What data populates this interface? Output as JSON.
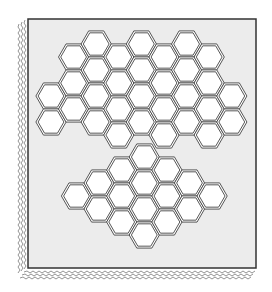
{
  "figure": {
    "colors": {
      "panel_fill": "#ececec",
      "panel_border": "#333333",
      "hex_fill": "#ffffff",
      "hex_stroke": "#444444",
      "page_edge": "#777777"
    },
    "panel": {
      "x": 28,
      "y": 19,
      "width": 228,
      "height": 249
    },
    "hex_radius": 13.5,
    "upper_cluster": {
      "label": "upper-hex-cluster",
      "column_spacing": 22.6,
      "row_spacing": 26,
      "origin_x": 51,
      "columns": [
        {
          "index": 0,
          "centers_y": [
            96,
            122
          ]
        },
        {
          "index": 1,
          "centers_y": [
            57,
            83,
            109
          ]
        },
        {
          "index": 2,
          "centers_y": [
            44,
            70,
            96,
            122
          ]
        },
        {
          "index": 3,
          "centers_y": [
            57,
            83,
            109,
            135
          ]
        },
        {
          "index": 4,
          "centers_y": [
            44,
            70,
            96,
            122
          ]
        },
        {
          "index": 5,
          "centers_y": [
            57,
            83,
            109,
            135
          ]
        },
        {
          "index": 6,
          "centers_y": [
            44,
            70,
            96,
            122
          ]
        },
        {
          "index": 7,
          "centers_y": [
            57,
            83,
            109,
            135
          ]
        },
        {
          "index": 8,
          "centers_y": [
            96,
            122
          ]
        }
      ]
    },
    "lower_cluster": {
      "label": "lower-hex-cluster",
      "column_spacing": 22.6,
      "row_spacing": 26,
      "origin_x": 76.5,
      "columns": [
        {
          "index": 0,
          "centers_y": [
            196
          ]
        },
        {
          "index": 1,
          "centers_y": [
            183,
            209
          ]
        },
        {
          "index": 2,
          "centers_y": [
            170,
            196,
            222
          ]
        },
        {
          "index": 3,
          "centers_y": [
            157,
            183,
            209,
            235
          ]
        },
        {
          "index": 4,
          "centers_y": [
            170,
            196,
            222
          ]
        },
        {
          "index": 5,
          "centers_y": [
            183,
            209
          ]
        },
        {
          "index": 6,
          "centers_y": [
            196
          ]
        }
      ]
    }
  }
}
